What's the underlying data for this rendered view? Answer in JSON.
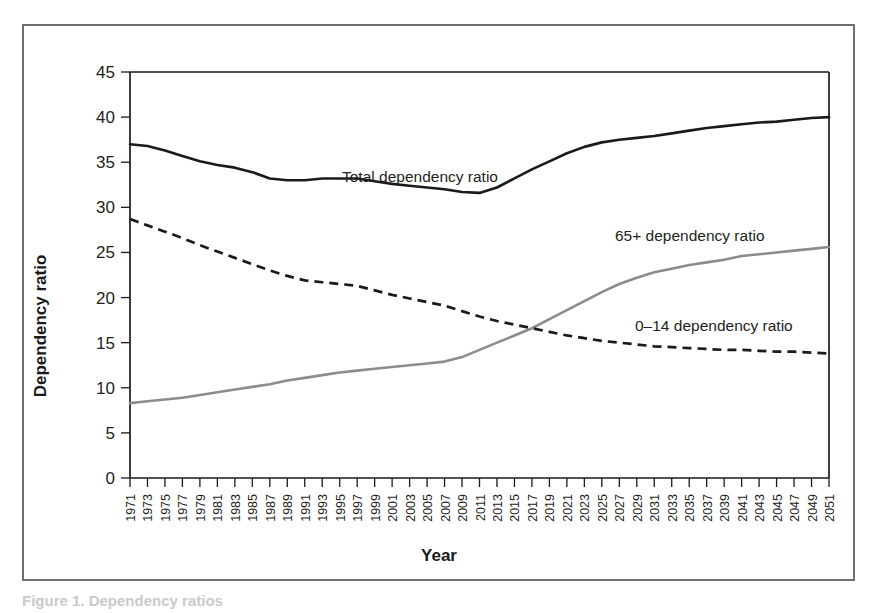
{
  "figure": {
    "background_color": "#ffffff",
    "border_color": "#6d6f71",
    "caption_clipped": "Figure 1. Dependency ratios"
  },
  "chart_data": {
    "type": "line",
    "title": "",
    "xlabel": "Year",
    "ylabel": "Dependency ratio",
    "xlim": [
      1971,
      2051
    ],
    "ylim": [
      0,
      45
    ],
    "yticks": [
      0,
      5,
      10,
      15,
      20,
      25,
      30,
      35,
      40,
      45
    ],
    "ytick_labels": [
      "0",
      "5",
      "10",
      "15",
      "20",
      "25",
      "30",
      "35",
      "40",
      "45"
    ],
    "grid": false,
    "legend_position": "inline-annotations",
    "x": [
      1971,
      1973,
      1975,
      1977,
      1979,
      1981,
      1983,
      1985,
      1987,
      1989,
      1991,
      1993,
      1995,
      1997,
      1999,
      2001,
      2003,
      2005,
      2007,
      2009,
      2011,
      2013,
      2015,
      2017,
      2019,
      2021,
      2023,
      2025,
      2027,
      2029,
      2031,
      2033,
      2035,
      2037,
      2039,
      2041,
      2043,
      2045,
      2047,
      2049,
      2051
    ],
    "xtick_labels": [
      "1971",
      "1973",
      "1975",
      "1977",
      "1979",
      "1981",
      "1983",
      "1985",
      "1987",
      "1989",
      "1991",
      "1993",
      "1995",
      "1997",
      "1999",
      "2001",
      "2003",
      "2005",
      "2007",
      "2009",
      "2011",
      "2013",
      "2015",
      "2017",
      "2019",
      "2021",
      "2023",
      "2025",
      "2027",
      "2029",
      "2031",
      "2033",
      "2035",
      "2037",
      "2039",
      "2041",
      "2043",
      "2045",
      "2047",
      "2049",
      "2051"
    ],
    "series": [
      {
        "name": "Total dependency ratio",
        "style": "solid",
        "color": "#1a1a1a",
        "label_text": "Total dependency ratio",
        "values": [
          37.0,
          36.8,
          36.3,
          35.7,
          35.1,
          34.7,
          34.4,
          33.9,
          33.2,
          33.0,
          33.0,
          33.2,
          33.2,
          33.2,
          32.9,
          32.6,
          32.4,
          32.2,
          32.0,
          31.7,
          31.6,
          32.2,
          33.2,
          34.2,
          35.1,
          36.0,
          36.7,
          37.2,
          37.5,
          37.7,
          37.9,
          38.2,
          38.5,
          38.8,
          39.0,
          39.2,
          39.4,
          39.5,
          39.7,
          39.9,
          40.0
        ]
      },
      {
        "name": "65+ dependency ratio",
        "style": "solid",
        "color": "#8a8c8e",
        "label_text": "65+ dependency ratio",
        "values": [
          8.3,
          8.5,
          8.7,
          8.9,
          9.2,
          9.5,
          9.8,
          10.1,
          10.4,
          10.8,
          11.1,
          11.4,
          11.7,
          11.9,
          12.1,
          12.3,
          12.5,
          12.7,
          12.9,
          13.4,
          14.2,
          15.0,
          15.8,
          16.6,
          17.6,
          18.6,
          19.6,
          20.6,
          21.5,
          22.2,
          22.8,
          23.2,
          23.6,
          23.9,
          24.2,
          24.6,
          24.8,
          25.0,
          25.2,
          25.4,
          25.6
        ]
      },
      {
        "name": "0-14 dependency ratio",
        "style": "dashed",
        "color": "#1a1a1a",
        "label_text": "0–14 dependency ratio",
        "values": [
          28.7,
          28.0,
          27.3,
          26.6,
          25.8,
          25.1,
          24.4,
          23.7,
          23.0,
          22.4,
          21.9,
          21.7,
          21.5,
          21.3,
          20.8,
          20.3,
          19.9,
          19.5,
          19.1,
          18.5,
          17.9,
          17.4,
          17.0,
          16.6,
          16.2,
          15.8,
          15.5,
          15.2,
          15.0,
          14.8,
          14.6,
          14.5,
          14.4,
          14.3,
          14.2,
          14.2,
          14.1,
          14.0,
          14.0,
          13.9,
          13.8
        ]
      }
    ]
  }
}
